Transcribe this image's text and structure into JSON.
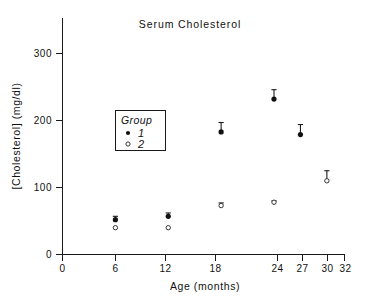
{
  "chart_data": {
    "type": "scatter",
    "title": "Serum Cholesterol",
    "xlabel": "Age (months)",
    "ylabel": "[Cholesterol] (mg/dl)",
    "xlim": [
      0,
      32
    ],
    "ylim": [
      0,
      320
    ],
    "grid": false,
    "legend_position": "inside-left",
    "legend_title": "Group",
    "xticks": [
      0,
      6,
      12,
      18,
      24,
      27,
      30,
      32
    ],
    "xtick_labels": [
      "0",
      "6",
      "12",
      "18",
      "24",
      "27",
      "30",
      "32"
    ],
    "yticks": [
      0,
      100,
      200,
      300
    ],
    "ytick_labels": [
      "0",
      "100",
      "200",
      "300"
    ],
    "series": [
      {
        "name": "1",
        "marker": "filled-circle",
        "x": [
          6,
          12,
          18,
          24,
          27
        ],
        "values": [
          52,
          57,
          183,
          232,
          179
        ],
        "err_up": [
          5,
          5,
          14,
          14,
          15
        ],
        "err_down": [
          0,
          0,
          0,
          0,
          0
        ]
      },
      {
        "name": "2",
        "marker": "open-circle",
        "x": [
          6,
          12,
          18,
          24,
          30
        ],
        "values": [
          40,
          40,
          73,
          78,
          110
        ],
        "err_up": [
          0,
          0,
          4,
          2,
          15
        ],
        "err_down": [
          0,
          0,
          0,
          0,
          0
        ]
      }
    ],
    "legend_entries": [
      {
        "label": "1",
        "marker": "filled-circle"
      },
      {
        "label": "2",
        "marker": "open-circle"
      }
    ]
  },
  "axes": {
    "title": "Serum Cholesterol",
    "x_axis_label": "Age (months)",
    "y_axis_label": "[Cholesterol] (mg/dl)",
    "y_tick_0": "0",
    "y_tick_100": "100",
    "y_tick_200": "200",
    "y_tick_300": "300",
    "x_tick_0": "0",
    "x_tick_6": "6",
    "x_tick_12": "12",
    "x_tick_18": "18",
    "x_tick_24": "24",
    "x_tick_27": "27",
    "x_tick_30": "30",
    "x_tick_32": "32"
  },
  "legend": {
    "title": "Group",
    "item_1_label": "1",
    "item_2_label": "2"
  }
}
